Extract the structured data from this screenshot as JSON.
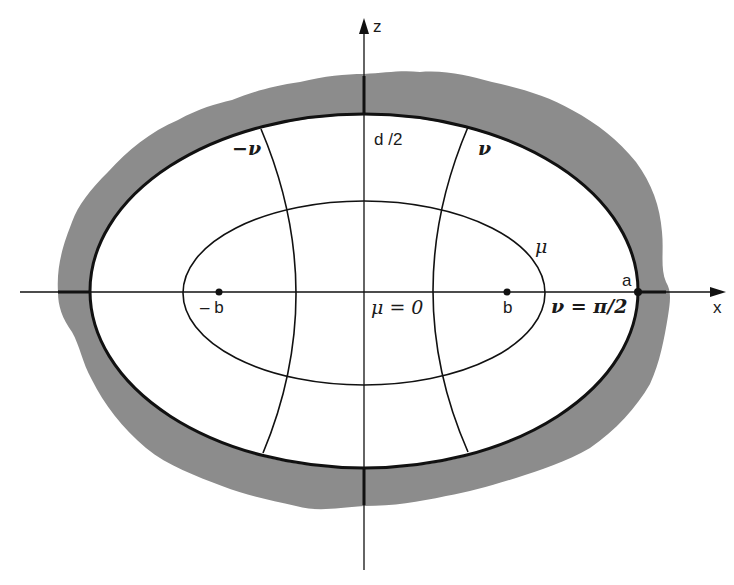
{
  "figure": {
    "colors": {
      "background": "#ffffff",
      "ink": "#111111",
      "shaded_wall": "#8c8c8c"
    },
    "axes": {
      "x_label": "x",
      "z_label": "z"
    },
    "labels": {
      "half_depth": "d /2",
      "minus_nu": "−ν",
      "nu": "ν",
      "mu": "μ",
      "mu_zero": "μ = 0",
      "minus_b": "– b",
      "b": "b",
      "a": "a",
      "nu_pi_half": "ν = π/2"
    },
    "geometry": {
      "center": [
        364,
        292
      ],
      "outer_ellipse": {
        "rx": 274,
        "ry": 177
      },
      "inner_ellipse": {
        "rx": 181,
        "ry": 92
      },
      "foci_x": [
        219,
        507
      ]
    }
  }
}
